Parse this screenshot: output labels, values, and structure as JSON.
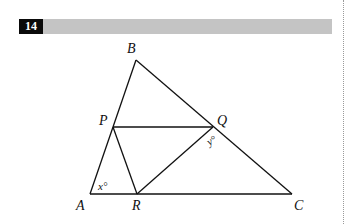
{
  "question": {
    "number": "14"
  },
  "diagram": {
    "vertices": {
      "A": {
        "label": "A",
        "x": 90,
        "y": 194
      },
      "B": {
        "label": "B",
        "x": 136,
        "y": 60
      },
      "C": {
        "label": "C",
        "x": 292,
        "y": 194
      },
      "P": {
        "label": "P",
        "x": 113,
        "y": 127
      },
      "Q": {
        "label": "Q",
        "x": 213,
        "y": 127
      },
      "R": {
        "label": "R",
        "x": 137,
        "y": 194
      }
    },
    "segments": [
      "AB",
      "BC",
      "AC",
      "PQ",
      "PR",
      "QR"
    ],
    "angles": {
      "x": {
        "label": "x°",
        "at": "A"
      },
      "y": {
        "label": "y°",
        "at": "Q"
      }
    },
    "line_color": "#111111"
  }
}
